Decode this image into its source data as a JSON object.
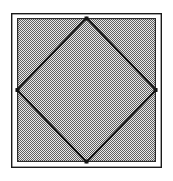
{
  "figure": {
    "caption": "",
    "background_color": "#ffffff",
    "outer_border": {
      "name": "outer-square-border",
      "stroke_color": "#1a1a1a",
      "stroke_width": 1.4,
      "fill": "none",
      "x": 11,
      "y": 13,
      "width": 151,
      "height": 155
    },
    "inner_square": {
      "name": "shaded-inner-square",
      "fill_pattern": "checker-dither-50",
      "fill_color_light": "#f2f2f2",
      "fill_color_dark": "#6e6e6e",
      "average_tone": "#9a9a9a",
      "stroke_color": "#2b2b2b",
      "stroke_width": 1.2,
      "x": 17,
      "y": 18,
      "width": 139,
      "height": 144
    },
    "diamond": {
      "name": "inscribed-diamond",
      "stroke_color": "#141414",
      "stroke_width": 2.1,
      "fill": "none",
      "vertices": [
        {
          "label": "top",
          "x": 86.5,
          "y": 18
        },
        {
          "label": "right",
          "x": 156,
          "y": 90
        },
        {
          "label": "bottom",
          "x": 86.5,
          "y": 162
        },
        {
          "label": "left",
          "x": 17,
          "y": 90
        }
      ]
    },
    "gap": {
      "name": "white-gap-between-borders",
      "color": "#ffffff",
      "width_px": 5
    }
  }
}
